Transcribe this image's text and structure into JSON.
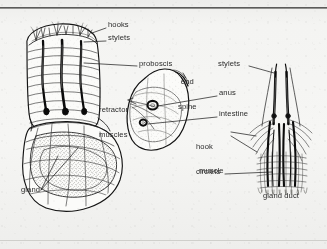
{
  "figure": {
    "caption_top_rule": true,
    "background_color": "#f4f4f2",
    "ink_color": "#1a1a1a"
  },
  "main_figure": {
    "name": "whole-larva-lateral-view",
    "description": "Segmented larva, anterior at top-left with proboscis and stylets, posterior curved to lower right with end spine, anus, intestine and gland"
  },
  "detail_figure": {
    "name": "stylet-apparatus-detail",
    "description": "Enlarged detail of paired stylets, hook circlets, muscle striations and gland duct"
  },
  "labels": [
    {
      "id": "hooks",
      "text": "hooks",
      "lines": [
        "hooks"
      ],
      "x": 108,
      "y": 25,
      "side": "left"
    },
    {
      "id": "stylets_left",
      "text": "stylets",
      "lines": [
        "stylets"
      ],
      "x": 108,
      "y": 38,
      "side": "left"
    },
    {
      "id": "proboscis",
      "text": "proboscis",
      "lines": [
        "proboscis"
      ],
      "x": 139,
      "y": 64,
      "side": "left"
    },
    {
      "id": "end_spine",
      "text": "end spine",
      "lines": [
        "end",
        "spine"
      ],
      "x": 178,
      "y": 65,
      "side": "left"
    },
    {
      "id": "retractor_muscles",
      "text": "retractor muscles",
      "lines": [
        "retractor",
        "muscles"
      ],
      "x": 101,
      "y": 93,
      "side": "right"
    },
    {
      "id": "anus",
      "text": "anus",
      "lines": [
        "anus"
      ],
      "x": 219,
      "y": 93,
      "side": "left"
    },
    {
      "id": "intestine",
      "text": "intestine",
      "lines": [
        "intestine"
      ],
      "x": 219,
      "y": 114,
      "side": "left"
    },
    {
      "id": "stylets_right",
      "text": "stylets",
      "lines": [
        "stylets"
      ],
      "x": 218,
      "y": 64,
      "side": "left"
    },
    {
      "id": "hook_circlets",
      "text": "hook circlets",
      "lines": [
        "hook",
        "circlets"
      ],
      "x": 196,
      "y": 130,
      "side": "right"
    },
    {
      "id": "muscle",
      "text": "muscle",
      "lines": [
        "muscle"
      ],
      "x": 200,
      "y": 171,
      "side": "left"
    },
    {
      "id": "gland",
      "text": "gland",
      "lines": [
        "gland"
      ],
      "x": 22,
      "y": 191,
      "side": "right"
    },
    {
      "id": "gland_duct",
      "text": "gland duct",
      "lines": [
        "gland duct"
      ],
      "x": 264,
      "y": 196,
      "side": "center"
    }
  ],
  "anatomy_parts": [
    "hooks",
    "stylets",
    "proboscis",
    "end spine",
    "retractor muscles",
    "anus",
    "intestine",
    "hook circlets",
    "muscle",
    "gland",
    "gland duct"
  ]
}
